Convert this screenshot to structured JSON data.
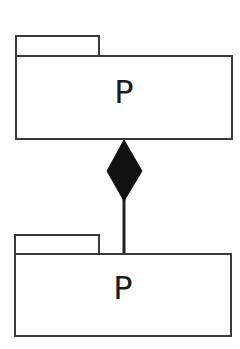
{
  "diagram": {
    "type": "UML package composition",
    "packages": [
      {
        "id": "top",
        "name": "P"
      },
      {
        "id": "bottom",
        "name": "P"
      }
    ],
    "relationship": {
      "kind": "composition",
      "from": "bottom",
      "to": "top",
      "end_marker": "filled-diamond",
      "marker_at": "top"
    },
    "colors": {
      "stroke": "#3a3a3a",
      "fill_diamond": "#111111",
      "background": "#ffffff",
      "text": "#1a1a1a"
    }
  }
}
